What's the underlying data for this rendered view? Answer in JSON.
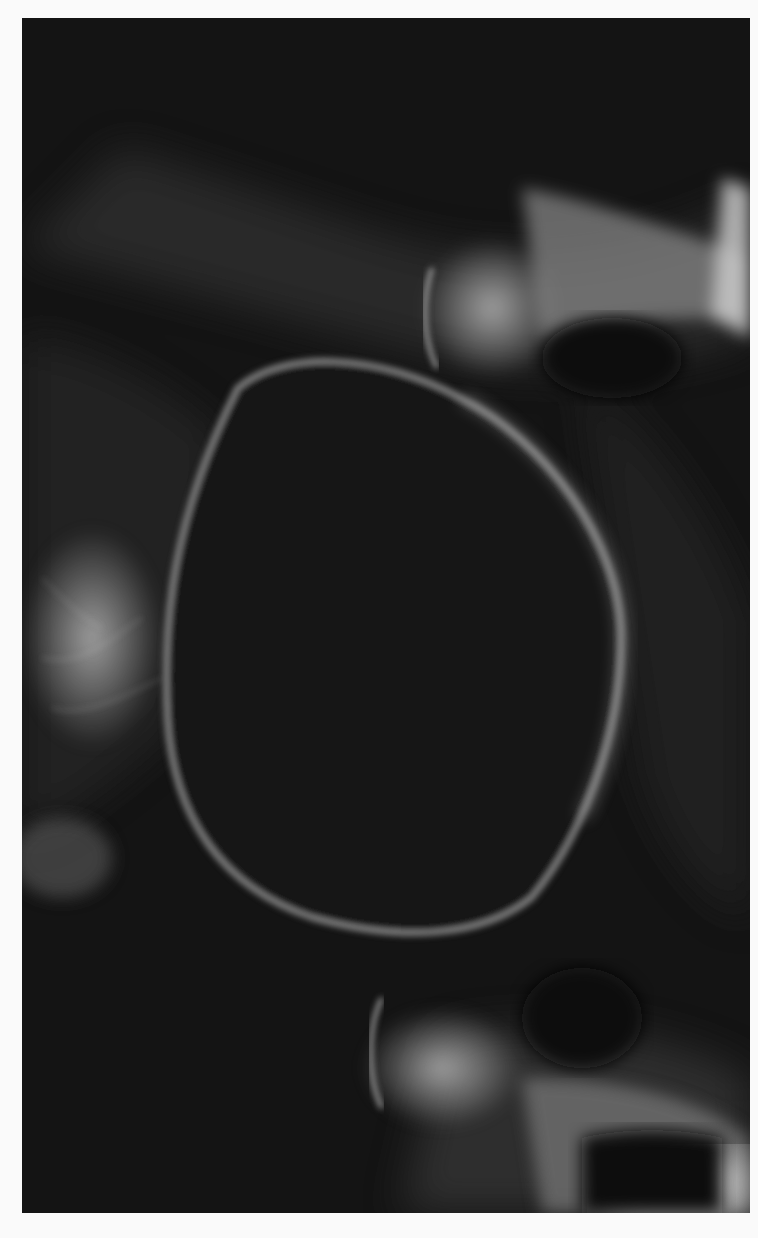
{
  "image": {
    "kind": "radiograph",
    "subject": "pelvis x-ray (rotated view)",
    "background_color": "#fafafa",
    "film_color": "#161616",
    "bone_highlight_color": "#d8d8d8"
  }
}
